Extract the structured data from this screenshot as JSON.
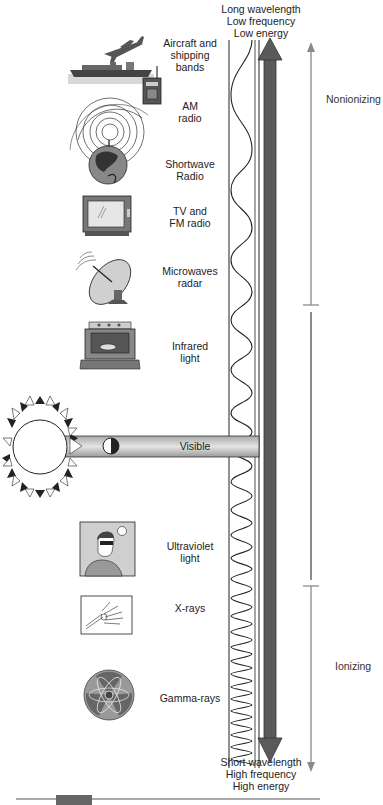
{
  "header": {
    "lines": [
      "Long wavelength",
      "Low frequency",
      "Low energy"
    ]
  },
  "footer": {
    "lines": [
      "Short wavelength",
      "High frequency",
      "High energy"
    ]
  },
  "categories": {
    "nonionizing": "Nonionizing",
    "ionizing": "Ionizing"
  },
  "bands": [
    {
      "id": "aircraft",
      "lines": [
        "Aircraft and",
        "shipping",
        "bands"
      ],
      "icon": "airplane-ship-icon"
    },
    {
      "id": "am",
      "lines": [
        "AM",
        "radio"
      ],
      "icon": "handheld-radio-icon"
    },
    {
      "id": "shortwave",
      "lines": [
        "Shortwave",
        "Radio"
      ],
      "icon": "globe-broadcast-icon"
    },
    {
      "id": "tv",
      "lines": [
        "TV and",
        "FM radio"
      ],
      "icon": "television-icon"
    },
    {
      "id": "microwave",
      "lines": [
        "Microwaves",
        "radar"
      ],
      "icon": "satellite-dish-icon"
    },
    {
      "id": "infrared",
      "lines": [
        "Infrared",
        "light"
      ],
      "icon": "oven-icon"
    },
    {
      "id": "visible",
      "lines": [
        "Visible"
      ],
      "icon": "sun-icon"
    },
    {
      "id": "uv",
      "lines": [
        "Ultraviolet",
        "light"
      ],
      "icon": "person-sunglasses-icon"
    },
    {
      "id": "xray",
      "lines": [
        "X-rays"
      ],
      "icon": "hand-xray-icon"
    },
    {
      "id": "gamma",
      "lines": [
        "Gamma-rays"
      ],
      "icon": "radiation-symbol-icon"
    }
  ],
  "colors": {
    "dark_arrow": "#5a5a5a",
    "thin_arrow": "#8a8a8a",
    "beam": "#c8c8c8",
    "line": "#222222"
  }
}
